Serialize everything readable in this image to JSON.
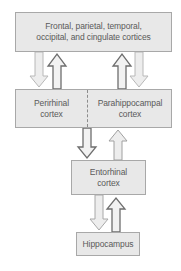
{
  "diagram": {
    "nodes": {
      "cortices": {
        "line1": "Frontal, parietal, temporal,",
        "line2": "occipital, and cingulate cortices"
      },
      "perirhinal": {
        "line1": "Perirhinal",
        "line2": "cortex"
      },
      "parahippocampal": {
        "line1": "Parahippocampal",
        "line2": "cortex"
      },
      "entorhinal": {
        "line1": "Entorhinal",
        "line2": "cortex"
      },
      "hippocampus": {
        "line1": "Hippocampus"
      }
    },
    "edges": [
      {
        "from": "cortices",
        "to": "perirhinal",
        "style": "light"
      },
      {
        "from": "perirhinal",
        "to": "cortices",
        "style": "outlined"
      },
      {
        "from": "parahippocampal",
        "to": "cortices",
        "style": "outlined"
      },
      {
        "from": "cortices",
        "to": "parahippocampal",
        "style": "light"
      },
      {
        "from": "perirhinal",
        "to": "entorhinal",
        "style": "outlined"
      },
      {
        "from": "entorhinal",
        "to": "parahippocampal",
        "style": "light"
      },
      {
        "from": "entorhinal",
        "to": "hippocampus",
        "style": "light"
      },
      {
        "from": "hippocampus",
        "to": "entorhinal",
        "style": "outlined"
      }
    ],
    "colors": {
      "box_fill": "#e8e8e8",
      "box_border": "#a8a8a8",
      "text": "#5a5a5a",
      "arrow_light_fill": "#ebebeb",
      "arrow_light_stroke": "#b4b4b4",
      "arrow_dark_stroke": "#6e6e6e"
    }
  }
}
